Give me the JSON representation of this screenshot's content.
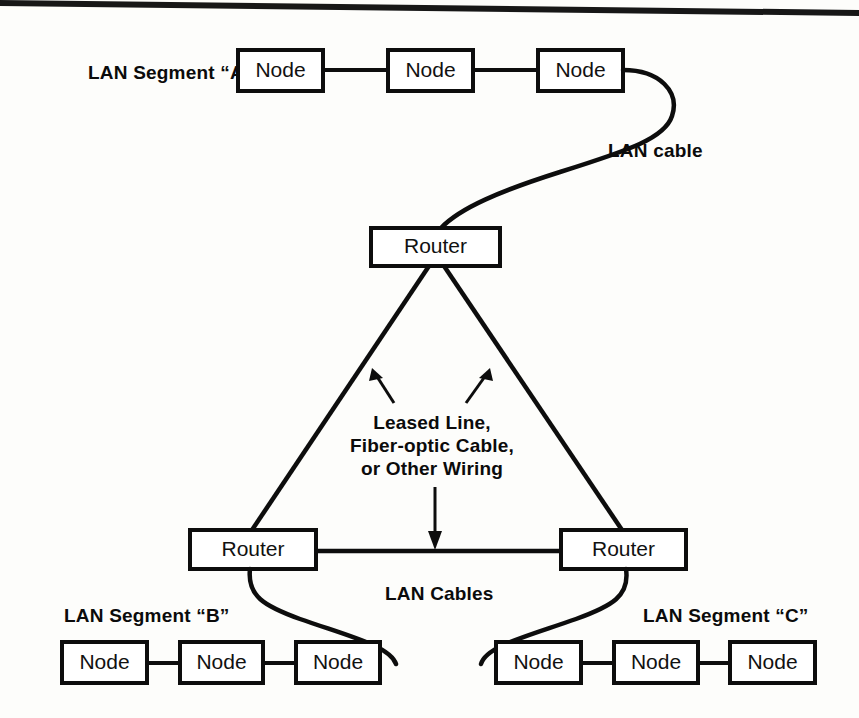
{
  "diagram": {
    "background_color": "#fdfdfb",
    "ink_color": "#0d0d0d"
  },
  "segments": {
    "a": {
      "label": "LAN Segment “A”",
      "nodes": [
        {
          "label": "Node"
        },
        {
          "label": "Node"
        },
        {
          "label": "Node"
        }
      ]
    },
    "b": {
      "label": "LAN Segment “B”",
      "nodes": [
        {
          "label": "Node"
        },
        {
          "label": "Node"
        },
        {
          "label": "Node"
        }
      ]
    },
    "c": {
      "label": "LAN Segment “C”",
      "nodes": [
        {
          "label": "Node"
        },
        {
          "label": "Node"
        },
        {
          "label": "Node"
        }
      ]
    }
  },
  "routers": {
    "top": {
      "label": "Router"
    },
    "bottom_left": {
      "label": "Router"
    },
    "bottom_right": {
      "label": "Router"
    }
  },
  "annotations": {
    "lan_cable_single": "LAN cable",
    "lan_cables_plural": "LAN Cables",
    "wan_link_line1": "Leased Line,",
    "wan_link_line2": "Fiber-optic Cable,",
    "wan_link_line3": "or Other Wiring"
  },
  "icons": {
    "arrow_up_left": "arrow-up-left-icon",
    "arrow_up_right": "arrow-up-right-icon",
    "arrow_down": "arrow-down-icon"
  }
}
